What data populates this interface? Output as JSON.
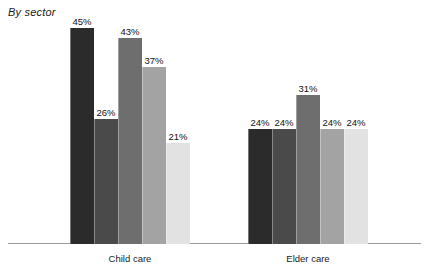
{
  "chart_data": {
    "type": "bar",
    "title": "By sector",
    "xlabel": "",
    "ylabel": "",
    "ylim": [
      0,
      48
    ],
    "grid": false,
    "legend": "none",
    "value_suffix": "%",
    "categories": [
      "Child care",
      "Elder care"
    ],
    "series": [
      {
        "name": "Series 1",
        "color": "#2b2b2b",
        "values": [
          45,
          24
        ]
      },
      {
        "name": "Series 2",
        "color": "#4a4a4a",
        "values": [
          26,
          24
        ]
      },
      {
        "name": "Series 3",
        "color": "#6e6e6e",
        "values": [
          43,
          31
        ]
      },
      {
        "name": "Series 4",
        "color": "#a3a3a3",
        "values": [
          37,
          24
        ]
      },
      {
        "name": "Series 5",
        "color": "#e2e2e2",
        "values": [
          21,
          24
        ]
      }
    ],
    "groups": [
      {
        "label": "Child care",
        "bars": [
          {
            "value": 45,
            "label": "45%",
            "color": "#2b2b2b"
          },
          {
            "value": 26,
            "label": "26%",
            "color": "#4a4a4a"
          },
          {
            "value": 43,
            "label": "43%",
            "color": "#6e6e6e"
          },
          {
            "value": 37,
            "label": "37%",
            "color": "#a3a3a3"
          },
          {
            "value": 21,
            "label": "21%",
            "color": "#e2e2e2"
          }
        ]
      },
      {
        "label": "Elder care",
        "bars": [
          {
            "value": 24,
            "label": "24%",
            "color": "#2b2b2b"
          },
          {
            "value": 24,
            "label": "24%",
            "color": "#4a4a4a"
          },
          {
            "value": 31,
            "label": "31%",
            "color": "#6e6e6e"
          },
          {
            "value": 24,
            "label": "24%",
            "color": "#a3a3a3"
          },
          {
            "value": 24,
            "label": "24%",
            "color": "#e2e2e2"
          }
        ]
      }
    ],
    "axis_color": "#9a9a9a",
    "background": "#ffffff"
  }
}
